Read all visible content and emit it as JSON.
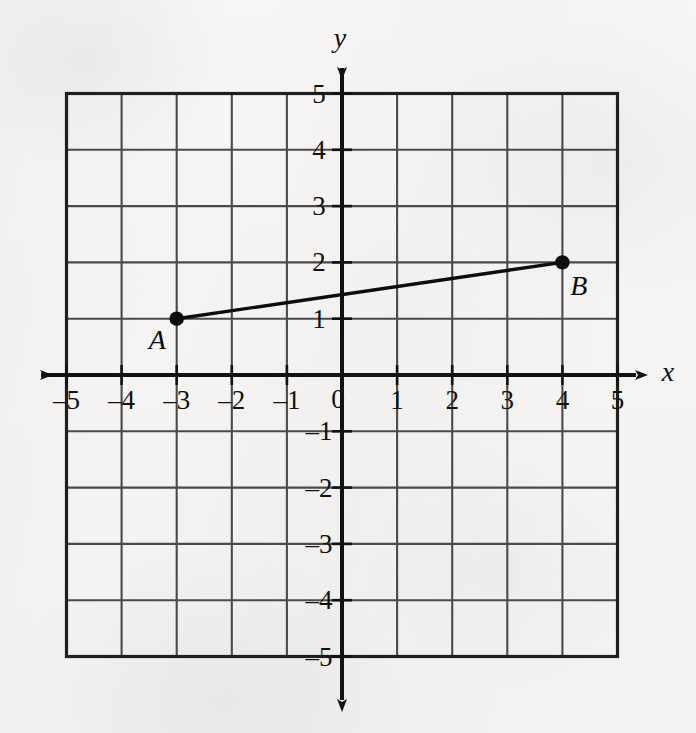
{
  "figure": {
    "background_color": "#f5f4f2",
    "ink_color": "#121212",
    "grid_color": "#4a4a4a",
    "x_axis_label": "x",
    "y_axis_label": "y",
    "origin_label": "0"
  },
  "chart_data": {
    "type": "line",
    "title": "",
    "xlabel": "x",
    "ylabel": "y",
    "xlim": [
      -5,
      5
    ],
    "ylim": [
      -5,
      5
    ],
    "grid": true,
    "grid_step": 1,
    "legend": "none",
    "x_tick_labels": [
      "–5",
      "–4",
      "–3",
      "–2",
      "–1",
      "0",
      "1",
      "2",
      "3",
      "4",
      "5"
    ],
    "x_tick_values": [
      -5,
      -4,
      -3,
      -2,
      -1,
      0,
      1,
      2,
      3,
      4,
      5
    ],
    "y_tick_labels": [
      "5",
      "4",
      "3",
      "2",
      "1",
      "–1",
      "–2",
      "–3",
      "–4",
      "–5"
    ],
    "y_tick_values": [
      5,
      4,
      3,
      2,
      1,
      -1,
      -2,
      -3,
      -4,
      -5
    ],
    "points": [
      {
        "name": "A",
        "x": -3,
        "y": 1,
        "label_dx": -0.35,
        "label_dy": -0.38
      },
      {
        "name": "B",
        "x": 4,
        "y": 2,
        "label_dx": 0.3,
        "label_dy": -0.42
      }
    ],
    "series": [
      {
        "name": "segment AB",
        "x": [
          -3,
          4
        ],
        "values": [
          1,
          2
        ],
        "style": "solid",
        "color": "#0d0d0d"
      }
    ],
    "annotations": [
      {
        "text": "A",
        "x": -3,
        "y": 1
      },
      {
        "text": "B",
        "x": 4,
        "y": 2
      }
    ]
  }
}
